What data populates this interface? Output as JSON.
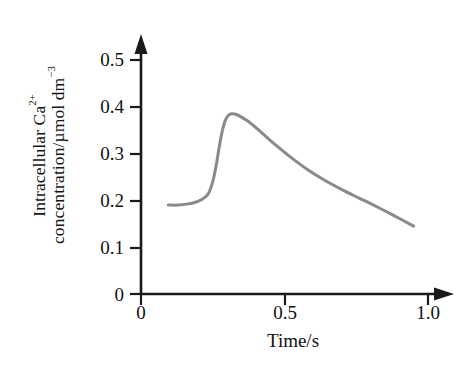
{
  "figure": {
    "background_color": "#ffffff",
    "axis_color": "#1a1a1a",
    "curve_color": "#8a8a8a"
  },
  "yaxis": {
    "title_line1_main": "Intracellular Ca",
    "title_line1_sup": "2+",
    "title_line2_main": "concentration/µmol dm",
    "title_line2_sup": "−3",
    "ticks": [
      "0",
      "0.1",
      "0.2",
      "0.3",
      "0.4",
      "0.5"
    ]
  },
  "xaxis": {
    "title": "Time/s",
    "ticks": [
      "0",
      "0.5",
      "1.0"
    ]
  },
  "chart_data": {
    "type": "line",
    "title": "",
    "xlabel": "Time/s",
    "ylabel": "Intracellular Ca2+ concentration/µmol dm-3",
    "xlim": [
      0,
      1.05
    ],
    "ylim": [
      0,
      0.52
    ],
    "xticks": [
      0,
      0.5,
      1.0
    ],
    "xtick_labels": [
      "0",
      "0.5",
      "1.0"
    ],
    "yticks": [
      0,
      0.1,
      0.2,
      0.3,
      0.4,
      0.5
    ],
    "ytick_labels": [
      "0",
      "0.1",
      "0.2",
      "0.3",
      "0.4",
      "0.5"
    ],
    "grid": false,
    "legend": false,
    "series": [
      {
        "name": "Intracellular Ca2+ concentration",
        "color": "#8a8a8a",
        "x": [
          0.095,
          0.13,
          0.16,
          0.19,
          0.215,
          0.235,
          0.25,
          0.262,
          0.272,
          0.282,
          0.292,
          0.302,
          0.315,
          0.33,
          0.35,
          0.38,
          0.42,
          0.47,
          0.52,
          0.58,
          0.64,
          0.7,
          0.76,
          0.82,
          0.88,
          0.95
        ],
        "y": [
          0.19,
          0.19,
          0.192,
          0.196,
          0.203,
          0.215,
          0.24,
          0.275,
          0.312,
          0.345,
          0.368,
          0.38,
          0.385,
          0.384,
          0.378,
          0.366,
          0.345,
          0.318,
          0.293,
          0.266,
          0.243,
          0.223,
          0.205,
          0.187,
          0.168,
          0.145
        ]
      }
    ]
  }
}
